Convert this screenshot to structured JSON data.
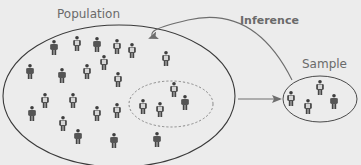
{
  "diagram": {
    "labels": {
      "population": "Population",
      "inference": "Inference",
      "sample": "Sample"
    },
    "colors": {
      "background": "#ececec",
      "outline": "#3a3a3a",
      "arrow": "#6e6e6e",
      "dashed": "#8a8a8a",
      "figure_dark": "#4a4a4a",
      "figure_light": "#d9d9d9",
      "label": "#6a6a6a"
    },
    "population": {
      "ellipse": {
        "cx": 119,
        "cy": 96,
        "rx": 116,
        "ry": 71
      },
      "figures": [
        {
          "x": 54,
          "y": 48,
          "style": "plain"
        },
        {
          "x": 77,
          "y": 44,
          "style": "vest"
        },
        {
          "x": 97,
          "y": 45,
          "style": "plain"
        },
        {
          "x": 117,
          "y": 47,
          "style": "vest"
        },
        {
          "x": 132,
          "y": 51,
          "style": "vest"
        },
        {
          "x": 166,
          "y": 59,
          "style": "vest"
        },
        {
          "x": 30,
          "y": 72,
          "style": "plain"
        },
        {
          "x": 62,
          "y": 76,
          "style": "plain"
        },
        {
          "x": 87,
          "y": 72,
          "style": "vest"
        },
        {
          "x": 104,
          "y": 63,
          "style": "vest"
        },
        {
          "x": 118,
          "y": 80,
          "style": "vest"
        },
        {
          "x": 45,
          "y": 101,
          "style": "vest"
        },
        {
          "x": 73,
          "y": 101,
          "style": "vest"
        },
        {
          "x": 32,
          "y": 114,
          "style": "plain"
        },
        {
          "x": 63,
          "y": 124,
          "style": "vest"
        },
        {
          "x": 97,
          "y": 114,
          "style": "vest"
        },
        {
          "x": 117,
          "y": 111,
          "style": "vest"
        },
        {
          "x": 78,
          "y": 137,
          "style": "plain"
        },
        {
          "x": 114,
          "y": 141,
          "style": "plain"
        },
        {
          "x": 157,
          "y": 140,
          "style": "plain"
        }
      ]
    },
    "subset": {
      "ellipse": {
        "cx": 171,
        "cy": 104,
        "rx": 42,
        "ry": 23
      },
      "figures": [
        {
          "x": 143,
          "y": 107,
          "style": "vest"
        },
        {
          "x": 160,
          "y": 110,
          "style": "vest"
        },
        {
          "x": 174,
          "y": 90,
          "style": "vest"
        },
        {
          "x": 185,
          "y": 103,
          "style": "plain"
        }
      ]
    },
    "sample": {
      "ellipse": {
        "cx": 320,
        "cy": 99,
        "rx": 37,
        "ry": 23
      },
      "figures": [
        {
          "x": 291,
          "y": 99,
          "style": "vest"
        },
        {
          "x": 308,
          "y": 107,
          "style": "vest"
        },
        {
          "x": 320,
          "y": 88,
          "style": "vest"
        },
        {
          "x": 334,
          "y": 102,
          "style": "plain"
        }
      ]
    },
    "arrows": {
      "sampling": {
        "from": [
          238,
          99
        ],
        "to": [
          280,
          99
        ]
      },
      "inference": {
        "from": [
          292,
          80
        ],
        "to": [
          150,
          38
        ]
      }
    }
  }
}
